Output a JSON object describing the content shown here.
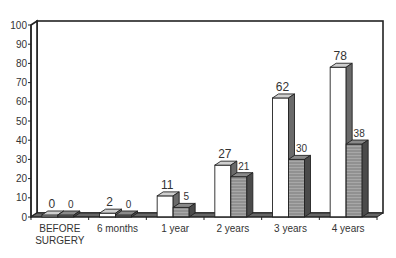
{
  "chart_data": {
    "type": "bar",
    "style": "3d-clustered",
    "title": "",
    "xlabel": "",
    "ylabel": "",
    "ylim": [
      0,
      100
    ],
    "yticks": [
      0,
      10,
      20,
      30,
      40,
      50,
      60,
      70,
      80,
      90,
      100
    ],
    "grid": false,
    "legend": null,
    "categories": [
      "BEFORE SURGERY",
      "6 months",
      "1 year",
      "2 years",
      "3 years",
      "4 years"
    ],
    "category_label_lines": [
      [
        "BEFORE",
        "SURGERY"
      ],
      [
        "6 months"
      ],
      [
        "1 year"
      ],
      [
        "2 years"
      ],
      [
        "3 years"
      ],
      [
        "4 years"
      ]
    ],
    "series": [
      {
        "name": "Series 1 (white bars)",
        "color": "#ffffff",
        "values": [
          0,
          2,
          11,
          27,
          62,
          78
        ]
      },
      {
        "name": "Series 2 (gray hatched bars)",
        "color": "#9a9a9a",
        "values": [
          0,
          0,
          5,
          21,
          30,
          38
        ]
      }
    ]
  }
}
